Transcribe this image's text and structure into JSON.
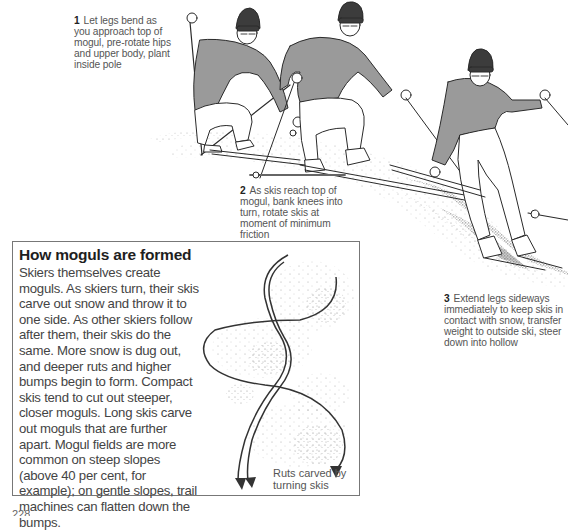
{
  "page": {
    "type": "instructional-book-page",
    "topic": "Skiing moguls"
  },
  "captions": [
    {
      "number": "1",
      "text": "Let legs bend as you approach top of mogul, pre-rotate hips and upper body, plant inside pole"
    },
    {
      "number": "2",
      "text": "As skis reach top of mogul, bank knees into turn, rotate skis at moment of minimum friction"
    },
    {
      "number": "3",
      "text": "Extend legs sideways immediately to keep skis in contact with snow, transfer weight to outside ski, steer down into hollow"
    }
  ],
  "sidebar_box": {
    "title": "How moguls are formed",
    "body": "Skiers themselves create moguls. As skiers turn, their skis carve out snow and throw it to one side. As other skiers follow after them, their skis do the same. More snow is dug out, and deeper ruts and higher bumps begin to form. Compact skis tend to cut out steeper, closer moguls. Long skis carve out moguls that are further apart. Mogul fields are more common on steep slopes (above 40 per cent, for example); on gentle slopes, trail machines can flatten down the bumps.",
    "diagram_label": "Ruts carved by turning skis"
  },
  "illustrations": {
    "skiers": [
      {
        "id": "skier-1",
        "pose": "approach top of mogul, pole planted"
      },
      {
        "id": "skier-2",
        "pose": "at top of mogul, banking knees"
      },
      {
        "id": "skier-3",
        "pose": "extending legs, steering into hollow"
      }
    ],
    "colors": {
      "sweater": "#9a9a9a",
      "hat": "#3c3c3c",
      "outline": "#2a2a2a",
      "snow_stipple": "#6a6a6a"
    }
  },
  "footer": {
    "page_number": "228"
  }
}
